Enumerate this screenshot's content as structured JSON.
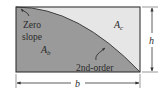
{
  "figure": {
    "type": "spandrel-area-diagram",
    "colors": {
      "shaded_region": "#9a9a9a",
      "unshaded_region": "#e6e6e6",
      "outline": "#333333",
      "background": "#ffffff"
    },
    "regions": {
      "under_curve": {
        "symbol": "A",
        "subscript": "b"
      },
      "above_curve": {
        "symbol": "A",
        "subscript": "c"
      }
    },
    "annotations": {
      "zero_slope_line1": "Zero",
      "zero_slope_line2": "slope",
      "curve_order": "2nd-order"
    },
    "dimensions": {
      "width": "b",
      "height": "h"
    }
  }
}
